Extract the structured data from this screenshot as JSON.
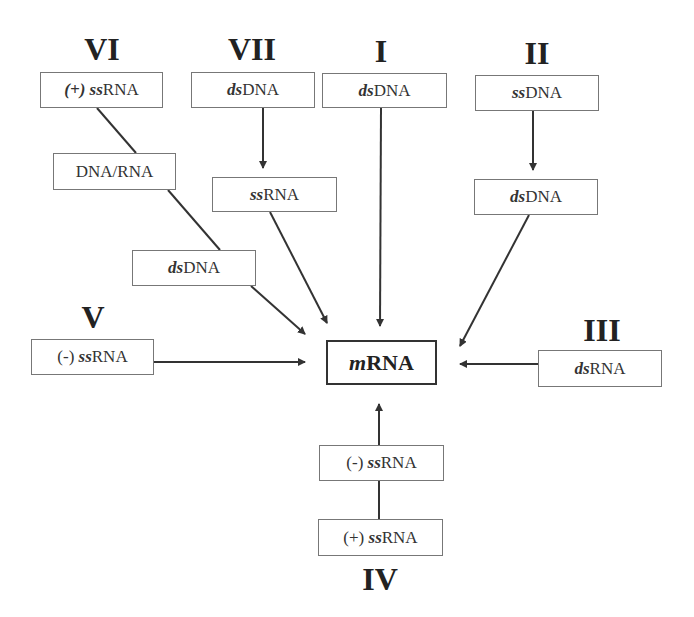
{
  "diagram": {
    "center": {
      "prefix": "m",
      "suffix": "RNA"
    },
    "classes": [
      {
        "numeral": "VI",
        "steps": [
          {
            "prefix_plain": "",
            "prefix_italic": "(+) ss",
            "suffix": "RNA"
          },
          {
            "prefix_plain": "",
            "prefix_italic": "",
            "suffix": "DNA/RNA"
          },
          {
            "prefix_plain": "",
            "prefix_italic": "ds",
            "suffix": "DNA"
          }
        ]
      },
      {
        "numeral": "VII",
        "steps": [
          {
            "prefix_plain": "",
            "prefix_italic": "ds",
            "suffix": "DNA"
          },
          {
            "prefix_plain": "",
            "prefix_italic": "ss",
            "suffix": "RNA"
          }
        ]
      },
      {
        "numeral": "I",
        "steps": [
          {
            "prefix_plain": "",
            "prefix_italic": "ds",
            "suffix": "DNA"
          }
        ]
      },
      {
        "numeral": "II",
        "steps": [
          {
            "prefix_plain": "",
            "prefix_italic": "ss",
            "suffix": "DNA"
          },
          {
            "prefix_plain": "",
            "prefix_italic": "ds",
            "suffix": "DNA"
          }
        ]
      },
      {
        "numeral": "V",
        "steps": [
          {
            "prefix_plain": "(-) ",
            "prefix_italic": "ss",
            "suffix": "RNA"
          }
        ]
      },
      {
        "numeral": "III",
        "steps": [
          {
            "prefix_plain": "",
            "prefix_italic": "ds",
            "suffix": "RNA"
          }
        ]
      },
      {
        "numeral": "IV",
        "steps": [
          {
            "prefix_plain": "(+) ",
            "prefix_italic": "ss",
            "suffix": "RNA"
          },
          {
            "prefix_plain": "(-) ",
            "prefix_italic": "ss",
            "suffix": "RNA"
          }
        ]
      }
    ],
    "colors": {
      "line": "#333333",
      "box_border": "#777777",
      "text": "#222222",
      "background": "#ffffff"
    }
  }
}
